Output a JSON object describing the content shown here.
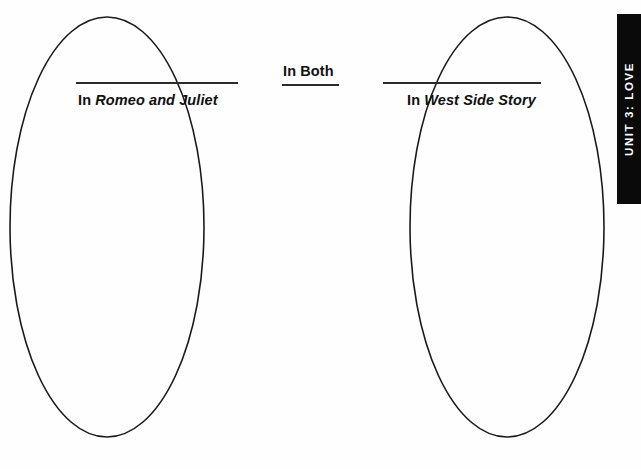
{
  "page": {
    "background_color": "#fefefe",
    "stroke_color": "#1a1a1a"
  },
  "diagram": {
    "type": "venn-2-circle",
    "left_circle": {
      "cx": 107,
      "cy": 227,
      "rx": 97,
      "ry": 210
    },
    "right_circle": {
      "cx": 507,
      "cy": 227,
      "rx": 97,
      "ry": 210
    }
  },
  "labels": {
    "left": {
      "prefix": "In ",
      "title": "Romeo and Juliet",
      "full": "In Romeo and Juliet"
    },
    "both": {
      "full": "In Both"
    },
    "right": {
      "prefix": "In ",
      "title": "West Side Story",
      "full": "In West Side Story"
    }
  },
  "unit_tab": {
    "text": "UNIT 3: LOVE",
    "background_color": "#0a0a0a",
    "text_color": "#ffffff"
  }
}
